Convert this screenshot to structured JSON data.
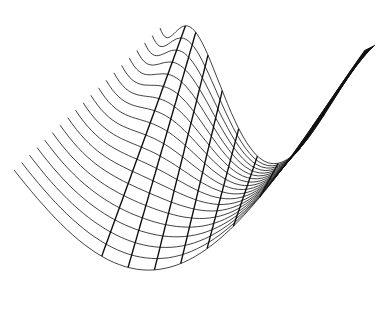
{
  "chart_data": {
    "type": "wireframe-surface",
    "title": "",
    "xlabel": "",
    "ylabel": "",
    "zlabel": "",
    "grid": false,
    "legend": null,
    "line_color": "#111111",
    "background": "#ffffff",
    "surface": {
      "description": "3D wireframe surface of a wavy saddle-like function, viewed obliquely; lines along one axis appear as thin ribs from upper-left down into a trough and up to a right peak, lines along the other axis appear as bold sinusoidal humps",
      "rib_count": 20,
      "cross_count": 9,
      "samples": 60,
      "corner_far_left": [
        14,
        170
      ],
      "corner_far_right": [
        160,
        28
      ],
      "corner_near_left": [
        215,
        300
      ],
      "corner_near_right": [
        375,
        45
      ],
      "trough_depth": 130,
      "hump_height": 95,
      "hump_frequency": 1.0
    }
  }
}
